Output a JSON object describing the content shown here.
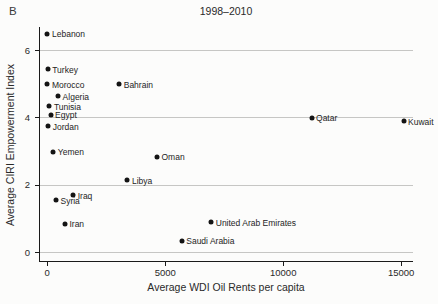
{
  "figure": {
    "panel_label": "B"
  },
  "chart_data": {
    "type": "scatter",
    "title": "1998–2010",
    "xlabel": "Average WDI Oil Rents per capita",
    "ylabel": "Average CIRI Empowerment Index",
    "xlim": [
      -350,
      15500
    ],
    "ylim": [
      -0.25,
      6.7
    ],
    "xticks": [
      0,
      5000,
      10000,
      15000
    ],
    "yticks": [
      0,
      2,
      4,
      6
    ],
    "grid": "horizontal gridlines at y ticks",
    "legend": "none",
    "colors": {
      "point": "#141414",
      "grid": "#c6c6c4",
      "axis": "#1a1a1a",
      "tick_text": "#2a2a2a"
    },
    "points": [
      {
        "label": "Lebanon",
        "x": 10,
        "y": 6.5
      },
      {
        "label": "Turkey",
        "x": 20,
        "y": 5.45
      },
      {
        "label": "Morocco",
        "x": 10,
        "y": 5.0
      },
      {
        "label": "Bahrain",
        "x": 3050,
        "y": 5.0
      },
      {
        "label": "Algeria",
        "x": 460,
        "y": 4.65
      },
      {
        "label": "Tunisia",
        "x": 90,
        "y": 4.35
      },
      {
        "label": "Egypt",
        "x": 140,
        "y": 4.1
      },
      {
        "label": "Jordan",
        "x": 40,
        "y": 3.75
      },
      {
        "label": "Qatar",
        "x": 11200,
        "y": 4.0
      },
      {
        "label": "Kuwait",
        "x": 15100,
        "y": 3.9
      },
      {
        "label": "Yemen",
        "x": 255,
        "y": 3.0
      },
      {
        "label": "Oman",
        "x": 4650,
        "y": 2.85
      },
      {
        "label": "Libya",
        "x": 3400,
        "y": 2.15
      },
      {
        "label": "Syria",
        "x": 370,
        "y": 1.55
      },
      {
        "label": "Iraq",
        "x": 1100,
        "y": 1.7
      },
      {
        "label": "Iran",
        "x": 750,
        "y": 0.85
      },
      {
        "label": "United Arab Emirates",
        "x": 6950,
        "y": 0.9
      },
      {
        "label": "Saudi Arabia",
        "x": 5700,
        "y": 0.35
      }
    ]
  }
}
